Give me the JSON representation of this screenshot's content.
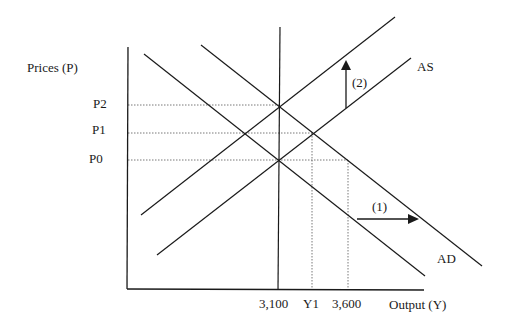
{
  "axes": {
    "y_label": "Prices (P)",
    "x_label": "Output (Y)"
  },
  "y_ticks": [
    {
      "label": "P2"
    },
    {
      "label": "P1"
    },
    {
      "label": "P0"
    }
  ],
  "x_ticks": [
    {
      "label": "3,100"
    },
    {
      "label": "Y1"
    },
    {
      "label": "3,600"
    }
  ],
  "curves": {
    "as_label": "AS",
    "ad_label": "AD"
  },
  "annotations": {
    "shift_1": "(1)",
    "shift_2": "(2)"
  },
  "colors": {
    "line": "#1a1a1a",
    "guide": "#555555",
    "background": "#ffffff"
  }
}
